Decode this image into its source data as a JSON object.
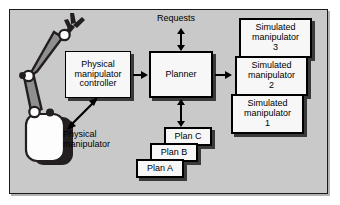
{
  "figure": {
    "background_color": "#c9c9c9",
    "frame_color": "#1a1a1a"
  },
  "labels": {
    "requests": "Requests",
    "physical_manipulator": "Physical\nmanipulator"
  },
  "nodes": {
    "physical_manipulator_controller": {
      "line1": "Physical",
      "line2": "manipulator",
      "line3": "controller"
    },
    "planner": {
      "label": "Planner"
    },
    "simulated_manipulator_3": {
      "line1": "Simulated",
      "line2": "manipulator",
      "line3": "3"
    },
    "simulated_manipulator_2": {
      "line1": "Simulated",
      "line2": "manipulator",
      "line3": "2"
    },
    "simulated_manipulator_1": {
      "line1": "Simulated",
      "line2": "manipulator",
      "line3": "1"
    },
    "plan_c": {
      "label": "Plan C"
    },
    "plan_b": {
      "label": "Plan B"
    },
    "plan_a": {
      "label": "Plan A"
    }
  },
  "captions": {
    "physical_manipulator_line1": "Physical",
    "physical_manipulator_line2": "manipulator"
  },
  "arrows": [
    {
      "name": "requests-to-planner",
      "kind": "double",
      "orientation": "vertical"
    },
    {
      "name": "controller-to-planner",
      "kind": "single",
      "orientation": "horizontal-right"
    },
    {
      "name": "planner-to-simulated-manipulator-2",
      "kind": "single",
      "orientation": "horizontal-right"
    },
    {
      "name": "planner-to-plan-c",
      "kind": "double",
      "orientation": "vertical"
    },
    {
      "name": "controller-to-physical-manipulator",
      "kind": "double",
      "orientation": "diagonal"
    }
  ],
  "colors": {
    "node_fill": "#f7f7f7",
    "node_border": "#000000",
    "shadow": "#3a3a3a",
    "arm_link": "#8a8a8a",
    "joint_fill": "#ffffff"
  }
}
